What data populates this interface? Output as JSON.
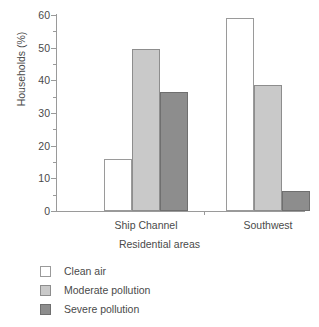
{
  "chart_data": {
    "type": "bar",
    "title": "",
    "subtitle": "",
    "xlabel": "Residential areas",
    "ylabel": "Households (%)",
    "categories": [
      "Ship Channel",
      "Southwest"
    ],
    "series": [
      {
        "name": "Clean air",
        "values": [
          16,
          59
        ],
        "color": "#ffffff"
      },
      {
        "name": "Moderate pollution",
        "values": [
          49.5,
          38.5
        ],
        "color": "#c9c9c9"
      },
      {
        "name": "Severe pollution",
        "values": [
          36.5,
          6
        ],
        "color": "#8d8d8d"
      }
    ],
    "ylim": [
      0,
      60
    ],
    "yticks": [
      0,
      10,
      20,
      30,
      40,
      50,
      60
    ],
    "ytick_labels": [
      "0",
      "10",
      "20",
      "30",
      "40",
      "50",
      "60"
    ],
    "yminor_ticks": [
      5,
      15,
      25,
      35,
      45,
      55
    ],
    "grid": false,
    "legend_position": "below-left",
    "legend_orientation": "vertical"
  },
  "axes": {
    "y_title": "Households (%)",
    "x_title": "Residential areas"
  }
}
